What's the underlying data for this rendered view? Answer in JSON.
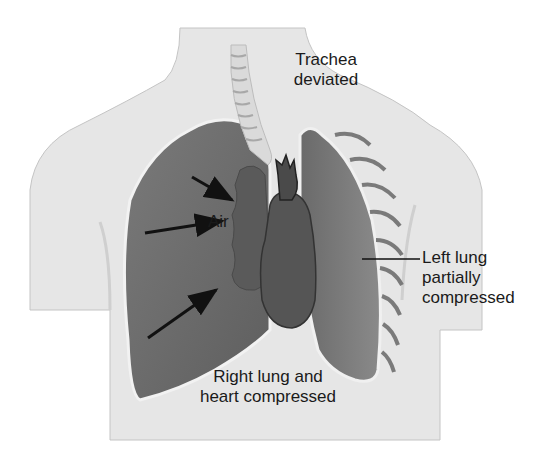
{
  "figure": {
    "labels": {
      "trachea": [
        "Trachea",
        "deviated"
      ],
      "air": "Air",
      "left_lung": [
        "Left lung",
        "partially",
        "compressed"
      ],
      "right_lung": [
        "Right lung and",
        "heart compressed"
      ]
    },
    "arrows": 3,
    "colors": {
      "background": "#ffffff",
      "body": "#e6e6e6",
      "body_outline": "#bdbdbd",
      "lung": "#6e6e6e",
      "lung_dark": "#555555",
      "pleura": "#f0f0f0",
      "heart": "#5a5a5a",
      "trachea": "#d9d9d9",
      "text": "#1a1a1a"
    }
  }
}
